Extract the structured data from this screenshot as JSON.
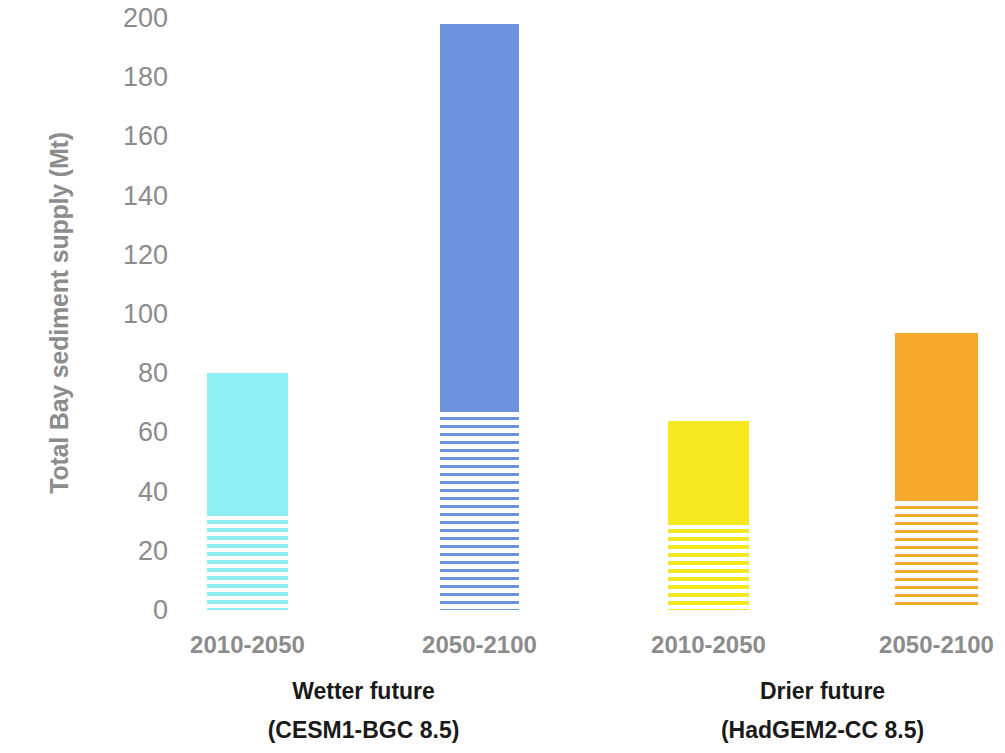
{
  "chart_data": {
    "type": "bar",
    "title": "",
    "subtitle": "",
    "xlabel": "",
    "ylabel": "Total Bay sediment supply (Mt)",
    "ylim": [
      0,
      200
    ],
    "ytick_step": 20,
    "yticks": [
      200,
      180,
      160,
      140,
      120,
      100,
      80,
      60,
      40,
      20,
      0
    ],
    "ytick_labels": [
      "200",
      "180",
      "160",
      "140",
      "120",
      "100",
      "80",
      "60",
      "40",
      "20",
      "0"
    ],
    "grid": false,
    "legend": "none",
    "stacked": true,
    "categories": [
      "2010-2050",
      "2050-2100",
      "2010-2050",
      "2050-2100"
    ],
    "groups": [
      {
        "name": "Wetter future",
        "model": "(CESM1-BGC 8.5)",
        "categories": [
          "2010-2050",
          "2050-2100"
        ]
      },
      {
        "name": "Drier future",
        "model": "(HadGEM2-CC 8.5)",
        "categories": [
          "2010-2050",
          "2050-2100"
        ]
      }
    ],
    "series": [
      {
        "name": "hatched lower segment",
        "values": [
          33,
          68,
          30,
          38
        ]
      },
      {
        "name": "solid upper segment",
        "values": [
          47,
          130,
          34,
          55.5
        ]
      }
    ],
    "totals": [
      80,
      198,
      64,
      93.5
    ],
    "bars": [
      {
        "label": "2010-2050",
        "group": "Wetter future",
        "total": 80,
        "hatched": 33,
        "solid": 47,
        "color": "#8FEFF7",
        "x": 207,
        "width": 81
      },
      {
        "label": "2050-2100",
        "group": "Wetter future",
        "total": 198,
        "hatched": 68,
        "solid": 130,
        "color": "#6C92DE",
        "x": 440,
        "width": 79
      },
      {
        "label": "2010-2050",
        "group": "Drier future",
        "total": 64,
        "hatched": 30,
        "solid": 34,
        "color": "#F5E81E",
        "x": 668,
        "width": 81
      },
      {
        "label": "2050-2100",
        "group": "Drier future",
        "total": 93.5,
        "hatched": 38,
        "solid": 55.5,
        "color": "#F5A82A",
        "x": 895,
        "width": 83
      }
    ],
    "colors": {
      "wetter_2010_2050": "#8FEFF7",
      "wetter_2050_2100": "#6C92DE",
      "drier_2010_2050": "#F5E81E",
      "drier_2050_2100": "#F5A82A",
      "axis_text": "#8C8C8C",
      "group_text": "#1A1A1A",
      "background": "#FFFFFF"
    }
  },
  "axes": {
    "y_title": "Total Bay sediment supply (Mt)",
    "y_ticks": [
      "200",
      "180",
      "160",
      "140",
      "120",
      "100",
      "80",
      "60",
      "40",
      "20",
      "0"
    ],
    "x_ticks": [
      "2010-2050",
      "2050-2100",
      "2010-2050",
      "2050-2100"
    ]
  },
  "groups": [
    {
      "name": "Wetter future",
      "model": "(CESM1-BGC 8.5)"
    },
    {
      "name": "Drier future",
      "model": "(HadGEM2-CC 8.5)"
    }
  ]
}
